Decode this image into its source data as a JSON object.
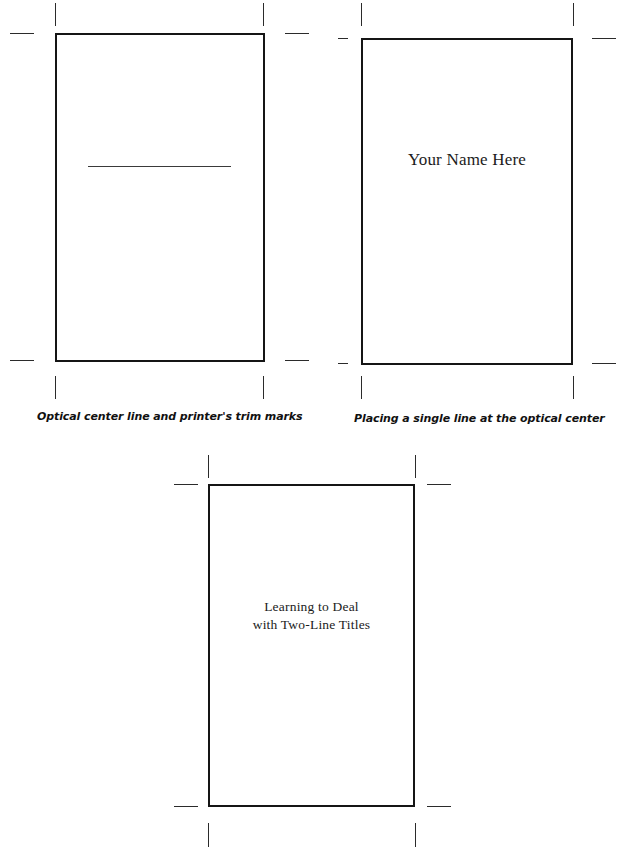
{
  "figure": {
    "kind": "typography-layout-diagram",
    "background_color": "#ffffff",
    "rule_color": "#3a3a3a",
    "box_border_color": "#151515",
    "trim_mark_color": "#2b2b2b",
    "text_color": "#1b1b1b"
  },
  "panels": [
    {
      "id": "panel-optical-center-line",
      "caption": "Optical center line and printer's trim marks",
      "title": "",
      "has_rule": true
    },
    {
      "id": "panel-single-line",
      "caption": "Placing a single line at the optical center",
      "title": "Your Name Here",
      "has_rule": false
    },
    {
      "id": "panel-two-line",
      "caption": "",
      "title_line_1": "Learning to Deal",
      "title_line_2": "with Two-Line Titles",
      "has_rule": false
    }
  ]
}
